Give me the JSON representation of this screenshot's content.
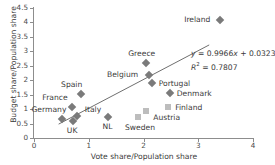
{
  "chart_data": {
    "type": "scatter",
    "title": "",
    "xlabel": "Vote share/Population share",
    "ylabel": "Budget share/Population share",
    "xlim": [
      0,
      4
    ],
    "ylim": [
      0,
      4.5
    ],
    "xticks": [
      "0",
      "1",
      "2",
      "3",
      "4"
    ],
    "yticks": [
      "0",
      "0.5",
      "1",
      "1.5",
      "2",
      "2.5",
      "3",
      "3.5",
      "4",
      "4.5"
    ],
    "grid": false,
    "legend": "none",
    "points": [
      {
        "label": "Germany",
        "x": 0.52,
        "y": 0.65,
        "marker": "diamond",
        "label_dx": -31,
        "label_dy": -14
      },
      {
        "label": "France",
        "x": 0.7,
        "y": 1.07,
        "marker": "diamond",
        "label_dx": -30,
        "label_dy": -14
      },
      {
        "label": "UK",
        "x": 0.71,
        "y": 0.6,
        "marker": "diamond",
        "label_dx": -6,
        "label_dy": 5
      },
      {
        "label": "Spain",
        "x": 0.86,
        "y": 1.52,
        "marker": "diamond",
        "label_dx": -20,
        "label_dy": -14
      },
      {
        "label": "Italy",
        "x": 0.78,
        "y": 0.76,
        "marker": "diamond",
        "label_dx": 8,
        "label_dy": -11
      },
      {
        "label": "NL",
        "x": 1.36,
        "y": 0.74,
        "marker": "diamond",
        "label_dx": -6,
        "label_dy": 5
      },
      {
        "label": "Sweden",
        "x": 1.9,
        "y": 0.72,
        "marker": "square",
        "label_dx": -13,
        "label_dy": 6
      },
      {
        "label": "Austria",
        "x": 2.05,
        "y": 0.93,
        "marker": "square",
        "label_dx": 7,
        "label_dy": 2
      },
      {
        "label": "Greece",
        "x": 2.05,
        "y": 2.61,
        "marker": "diamond",
        "label_dx": -18,
        "label_dy": -14
      },
      {
        "label": "Belgium",
        "x": 2.1,
        "y": 2.17,
        "marker": "diamond",
        "label_dx": -42,
        "label_dy": -5
      },
      {
        "label": "Portugal",
        "x": 2.15,
        "y": 1.9,
        "marker": "diamond",
        "label_dx": 7,
        "label_dy": -4
      },
      {
        "label": "Finland",
        "x": 2.45,
        "y": 1.07,
        "marker": "square",
        "label_dx": 7,
        "label_dy": -4
      },
      {
        "label": "Denmark",
        "x": 2.48,
        "y": 1.55,
        "marker": "diamond",
        "label_dx": 7,
        "label_dy": -4
      },
      {
        "label": "Ireland",
        "x": 3.4,
        "y": 4.07,
        "marker": "diamond",
        "label_dx": -36,
        "label_dy": -5
      }
    ],
    "trendline": {
      "slope": 0.9966,
      "intercept": 0.0323,
      "x_start": 0.45,
      "x_end": 3.2,
      "equation_text": "y = 0.9966x + 0.0323",
      "equation_y": "y",
      "equation_rest": " = 0.9966",
      "equation_x": "x",
      "equation_tail": " + 0.0323",
      "r2_symbol": "R",
      "r2_sup": "2",
      "r2_value": " = 0.7807",
      "r2_text": "R2 = 0.7807"
    },
    "colors": {
      "diamond_marker": "#7a7a7a",
      "square_marker": "#bdbdbd",
      "axis": "#8d8d8d",
      "text": "#3a3a3a",
      "trendline": "#6f6f6f"
    }
  }
}
